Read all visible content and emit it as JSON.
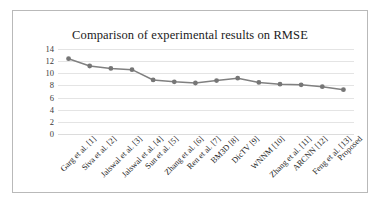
{
  "chart_data": {
    "type": "line",
    "title": "Comparison of experimental results on RMSE",
    "xlabel": "",
    "ylabel": "",
    "ylim": [
      0,
      14
    ],
    "yticks": [
      0,
      2,
      4,
      6,
      8,
      10,
      12,
      14
    ],
    "grid": true,
    "legend": false,
    "legend_position": "none",
    "categories": [
      "Garg et al. [1]",
      "Siva et al. [2]",
      "Jaiswal et al. [3]",
      "Jaiswal et al. [4]",
      "Sun et al. [5]",
      "Zhang et al. [6]",
      "Ren et al. [7]",
      "BM3D [8]",
      "DicTV [9]",
      "WNNM [10]",
      "Zhang et al. [11]",
      "ARCNN [12]",
      "Feng et al. [13]",
      "Proposed"
    ],
    "values": [
      12.4,
      11.2,
      10.8,
      10.6,
      8.9,
      8.6,
      8.4,
      8.8,
      9.2,
      8.5,
      8.2,
      8.1,
      7.8,
      7.3
    ],
    "series_color": "#808080",
    "marker": "circle",
    "marker_color": "#767676"
  }
}
